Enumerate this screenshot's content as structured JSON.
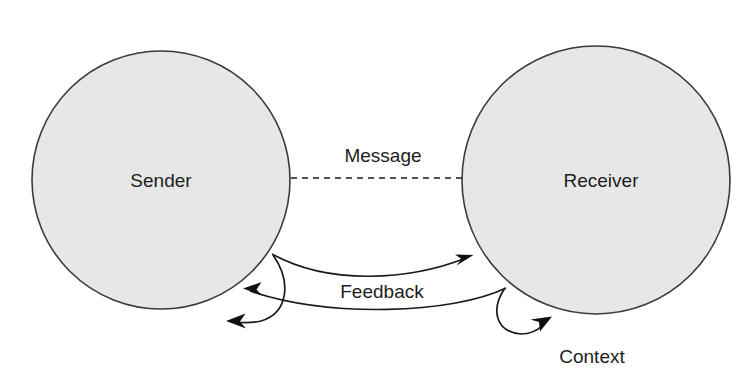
{
  "diagram": {
    "background_color": "#ffffff",
    "node_fill_color": "#e7e7e7",
    "node_stroke_color": "#3a3a3a",
    "line_color": "#1a1a1a",
    "text_color": "#1d1d1d",
    "nodes": [
      {
        "id": "sender",
        "label": "Sender",
        "shape": "circle",
        "cx": 161,
        "cy": 180,
        "r": 129,
        "label_x": 161,
        "label_y": 182
      },
      {
        "id": "receiver",
        "label": "Receiver",
        "shape": "circle",
        "cx": 596,
        "cy": 180,
        "r": 134,
        "label_x": 601,
        "label_y": 182
      }
    ],
    "edges": [
      {
        "id": "message",
        "label": "Message",
        "style": "dashed",
        "arrowheads": "none",
        "from": "sender",
        "to": "receiver",
        "label_x": 383,
        "label_y": 157
      },
      {
        "id": "feedback-forward",
        "label": "",
        "style": "solid",
        "arrowheads": "end",
        "from": "sender",
        "to": "receiver"
      },
      {
        "id": "feedback-return",
        "label": "Feedback",
        "style": "solid",
        "arrowheads": "end",
        "from": "receiver",
        "to": "sender",
        "label_x": 382,
        "label_y": 293
      },
      {
        "id": "sender-self-loop",
        "label": "",
        "style": "solid",
        "arrowheads": "end",
        "from": "sender",
        "to": "sender"
      },
      {
        "id": "receiver-self-loop",
        "label": "",
        "style": "solid",
        "arrowheads": "end",
        "from": "receiver",
        "to": "receiver"
      }
    ],
    "annotations": [
      {
        "id": "context",
        "label": "Context",
        "x": 592,
        "y": 358
      }
    ]
  }
}
